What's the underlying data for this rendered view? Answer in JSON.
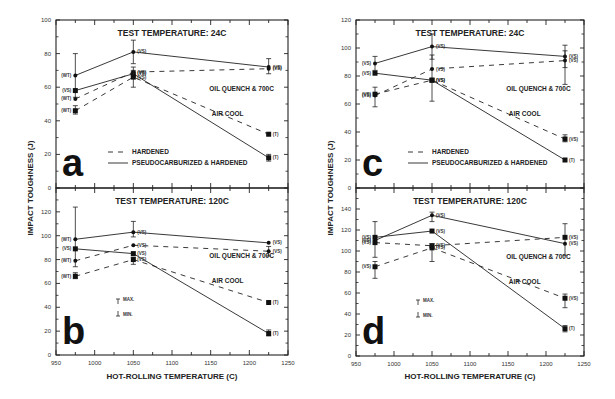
{
  "figure": {
    "y_axis_title": "IMPACT TOUGHNESS (J)",
    "x_axis_title": "HOT-ROLLING TEMPERATURE (C)",
    "legend_hardened": "HARDENED",
    "legend_pseudo": "PSEUDOCARBURIZED & HARDENED",
    "legend_max": "MAX.",
    "legend_min": "MIN.",
    "label_oil": "OIL QUENCH & 700C",
    "label_air": "AIR COOL"
  },
  "chart_data": [
    {
      "id": "a",
      "type": "line",
      "title": "TEST TEMPERATURE: 24C",
      "xlabel": "",
      "ylabel": "IMPACT TOUGHNESS (J)",
      "xlim": [
        950,
        1250
      ],
      "ylim": [
        0,
        100
      ],
      "yticks": [
        0,
        20,
        40,
        60,
        80,
        100
      ],
      "x": [
        975,
        1050,
        1225
      ],
      "series": [
        {
          "name": "Pseudocarburized & Hardened - Oil Quench & 700C",
          "style": "solid",
          "marker": "circle",
          "values": [
            67,
            81,
            72
          ],
          "err": [
            [
              80,
              54
            ],
            [
              88,
              74
            ],
            [
              77,
              68
            ]
          ],
          "labels": [
            "(WT)",
            "(VS)",
            "(VS)"
          ]
        },
        {
          "name": "Pseudocarburized & Hardened - Air Cool",
          "style": "solid",
          "marker": "square",
          "values": [
            58,
            68,
            18
          ],
          "err": [
            null,
            null,
            [
              20,
              16
            ]
          ],
          "labels": [
            "(VS)",
            "(VS)",
            "(T)"
          ]
        },
        {
          "name": "Hardened - Oil Quench & 700C",
          "style": "dashed",
          "marker": "circle",
          "values": [
            53,
            69,
            71
          ],
          "err": [
            null,
            [
              72,
              66
            ],
            null
          ],
          "labels": [
            "(WT)",
            "(VS)",
            "(VS)"
          ]
        },
        {
          "name": "Hardened - Air Cool",
          "style": "dashed",
          "marker": "square",
          "values": [
            46,
            66,
            32
          ],
          "err": [
            [
              49,
              44
            ],
            [
              70,
              60
            ],
            null
          ],
          "labels": [
            "(WT)",
            "(VS)",
            "(T)"
          ]
        }
      ],
      "annotations": [
        "OIL QUENCH & 700C",
        "AIR COOL",
        "HARDENED",
        "PSEUDOCARBURIZED & HARDENED",
        "a"
      ]
    },
    {
      "id": "b",
      "type": "line",
      "title": "TEST TEMPERATURE: 120C",
      "xlabel": "HOT-ROLLING TEMPERATURE (C)",
      "ylabel": "IMPACT TOUGHNESS (J)",
      "xlim": [
        950,
        1250
      ],
      "ylim": [
        0,
        140
      ],
      "yticks": [
        0,
        20,
        40,
        60,
        80,
        100,
        120
      ],
      "xticks": [
        950,
        1000,
        1050,
        1100,
        1150,
        1200,
        1250
      ],
      "x": [
        975,
        1050,
        1225
      ],
      "series": [
        {
          "name": "Pseudocarburized & Hardened - Oil Quench & 700C",
          "style": "solid",
          "marker": "circle",
          "values": [
            97,
            103,
            94
          ],
          "err": [
            [
              124,
              74
            ],
            [
              112,
              99
            ],
            null
          ],
          "labels": [
            "(WT)",
            "(VS)",
            "(VS)"
          ]
        },
        {
          "name": "Pseudocarburized & Hardened - Air Cool",
          "style": "solid",
          "marker": "square",
          "values": [
            89,
            85,
            18
          ],
          "err": [
            null,
            null,
            [
              21,
              16
            ]
          ],
          "labels": [
            "(VS)",
            "(VS)",
            "(T)"
          ]
        },
        {
          "name": "Hardened - Oil Quench & 700C",
          "style": "dashed",
          "marker": "circle",
          "values": [
            79,
            92,
            87
          ],
          "err": [
            null,
            null,
            [
              91,
              83
            ]
          ],
          "labels": [
            "(WT)",
            "(VS)",
            "(VS)"
          ]
        },
        {
          "name": "Hardened - Air Cool",
          "style": "dashed",
          "marker": "square",
          "values": [
            66,
            80,
            44
          ],
          "err": [
            [
              69,
              64
            ],
            [
              82,
              76
            ],
            null
          ],
          "labels": [
            "(WT)",
            "(VS)",
            "(T)"
          ]
        }
      ],
      "annotations": [
        "OIL QUENCH & 700C",
        "AIR COOL",
        "MAX.",
        "MIN.",
        "b"
      ]
    },
    {
      "id": "c",
      "type": "line",
      "title": "TEST TEMPERATURE: 24C",
      "xlabel": "",
      "ylabel": "IMPACT TOUGHNESS (J)",
      "xlim": [
        950,
        1250
      ],
      "ylim": [
        0,
        120
      ],
      "yticks": [
        0,
        20,
        40,
        60,
        80,
        100,
        120
      ],
      "x": [
        975,
        1050,
        1225
      ],
      "series": [
        {
          "name": "Pseudocarburized & Hardened - Oil Quench & 700C",
          "style": "solid",
          "marker": "circle",
          "values": [
            89,
            101,
            94
          ],
          "err": [
            [
              94,
              84
            ],
            [
              110,
              92
            ],
            [
              102,
              86
            ]
          ],
          "labels": [
            "(VS)",
            "(VS)",
            "(VS)"
          ]
        },
        {
          "name": "Pseudocarburized & Hardened - Air Cool",
          "style": "solid",
          "marker": "square",
          "values": [
            82,
            77,
            20
          ],
          "err": [
            null,
            [
              95,
              62
            ],
            null
          ],
          "labels": [
            "(VS)",
            "(VS)",
            "(T)"
          ]
        },
        {
          "name": "Hardened - Oil Quench & 700C",
          "style": "dashed",
          "marker": "circle",
          "values": [
            66,
            85,
            91
          ],
          "err": [
            [
              72,
              58
            ],
            null,
            [
              98,
              74
            ]
          ],
          "labels": [
            "(VS)",
            "(VS)",
            "(VS)"
          ]
        },
        {
          "name": "Hardened - Air Cool",
          "style": "dashed",
          "marker": "square",
          "values": [
            67,
            77,
            35
          ],
          "err": [
            null,
            null,
            [
              38,
              33
            ]
          ],
          "labels": [
            "(VS)",
            "(VS)",
            "(VS)"
          ]
        }
      ],
      "annotations": [
        "OIL QUENCH & 700C",
        "AIR COOL",
        "HARDENED",
        "PSEUDOCARBURIZED & HARDENED",
        "c"
      ]
    },
    {
      "id": "d",
      "type": "line",
      "title": "TEST TEMPERATURE: 120C",
      "xlabel": "HOT-ROLLING TEMPERATURE (C)",
      "ylabel": "IMPACT TOUGHNESS (J)",
      "xlim": [
        950,
        1250
      ],
      "ylim": [
        0,
        160
      ],
      "yticks": [
        0,
        20,
        40,
        60,
        80,
        100,
        120,
        140
      ],
      "xticks": [
        950,
        1000,
        1050,
        1100,
        1150,
        1200,
        1250
      ],
      "x": [
        975,
        1050,
        1225
      ],
      "series": [
        {
          "name": "Pseudocarburized & Hardened - Oil Quench & 700C",
          "style": "solid",
          "marker": "circle",
          "values": [
            110,
            134,
            107
          ],
          "err": [
            [
              128,
              94
            ],
            [
              137,
              128
            ],
            [
              126,
              96
            ]
          ],
          "labels": [
            "(VS)",
            "(VS)",
            "(VS)"
          ]
        },
        {
          "name": "Pseudocarburized & Hardened - Air Cool",
          "style": "solid",
          "marker": "square",
          "values": [
            113,
            119,
            26
          ],
          "err": [
            null,
            null,
            [
              29,
              23
            ]
          ],
          "labels": [
            "(VS)",
            "(VS)",
            "(T)"
          ]
        },
        {
          "name": "Hardened - Oil Quench & 700C",
          "style": "dashed",
          "marker": "square",
          "values": [
            108,
            105,
            113
          ],
          "err": [
            null,
            null,
            null
          ],
          "labels": [
            "(VS)",
            "(VS)",
            "(VS)"
          ]
        },
        {
          "name": "Hardened - Air Cool",
          "style": "dashed",
          "marker": "square",
          "values": [
            85,
            103,
            55
          ],
          "err": [
            [
              90,
              74
            ],
            [
              107,
              90
            ],
            [
              59,
              46
            ]
          ],
          "labels": [
            "(VS)",
            "(VS)",
            "(VS)"
          ]
        }
      ],
      "annotations": [
        "OIL QUENCH & 700C",
        "AIR COOL",
        "MAX.",
        "MIN.",
        "d"
      ]
    }
  ]
}
